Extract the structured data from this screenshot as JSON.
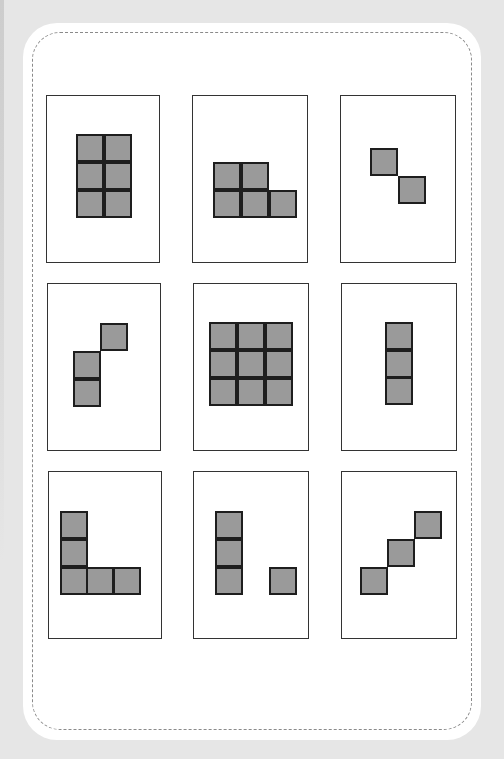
{
  "colors": {
    "background": "#e6e6e6",
    "panel": "#ffffff",
    "dashed_border": "#8a8a8a",
    "card_border": "#333333",
    "cell_fill": "#9a9a9a",
    "cell_border": "#1e1e1e"
  },
  "cell_size": 28,
  "cards": [
    {
      "name": "card-2x3-rectangle",
      "x": 46,
      "y": 95,
      "w": 114,
      "h": 168,
      "cells": [
        [
          76,
          134
        ],
        [
          104,
          134
        ],
        [
          76,
          162
        ],
        [
          104,
          162
        ],
        [
          76,
          190
        ],
        [
          104,
          190
        ]
      ]
    },
    {
      "name": "card-five-cell-step",
      "x": 192,
      "y": 95,
      "w": 116,
      "h": 168,
      "cells": [
        [
          213,
          162
        ],
        [
          241,
          162
        ],
        [
          213,
          190
        ],
        [
          241,
          190
        ],
        [
          269,
          190
        ]
      ]
    },
    {
      "name": "card-diagonal-two",
      "x": 340,
      "y": 95,
      "w": 116,
      "h": 168,
      "cells": [
        [
          370,
          148
        ],
        [
          398,
          176
        ]
      ]
    },
    {
      "name": "card-three-cell-s",
      "x": 47,
      "y": 283,
      "w": 114,
      "h": 168,
      "cells": [
        [
          100,
          323
        ],
        [
          73,
          351
        ],
        [
          73,
          379
        ]
      ]
    },
    {
      "name": "card-3x3-square",
      "x": 193,
      "y": 283,
      "w": 116,
      "h": 168,
      "cells": [
        [
          209,
          322
        ],
        [
          237,
          322
        ],
        [
          265,
          322
        ],
        [
          209,
          350
        ],
        [
          237,
          350
        ],
        [
          265,
          350
        ],
        [
          209,
          378
        ],
        [
          265,
          378
        ],
        [
          237,
          378
        ]
      ]
    },
    {
      "name": "card-vertical-three",
      "x": 341,
      "y": 283,
      "w": 116,
      "h": 168,
      "cells": [
        [
          385,
          322
        ],
        [
          385,
          350
        ],
        [
          385,
          377
        ]
      ]
    },
    {
      "name": "card-l-shape",
      "x": 48,
      "y": 471,
      "w": 114,
      "h": 168,
      "cells": [
        [
          60,
          511
        ],
        [
          60,
          539
        ],
        [
          60,
          567
        ],
        [
          86,
          567
        ],
        [
          113,
          567
        ]
      ]
    },
    {
      "name": "card-column-and-dot",
      "x": 193,
      "y": 471,
      "w": 116,
      "h": 168,
      "cells": [
        [
          215,
          511
        ],
        [
          215,
          539
        ],
        [
          215,
          567
        ],
        [
          269,
          567
        ]
      ]
    },
    {
      "name": "card-diagonal-three",
      "x": 341,
      "y": 471,
      "w": 116,
      "h": 168,
      "cells": [
        [
          360,
          567
        ],
        [
          387,
          539
        ],
        [
          414,
          511
        ]
      ]
    }
  ]
}
